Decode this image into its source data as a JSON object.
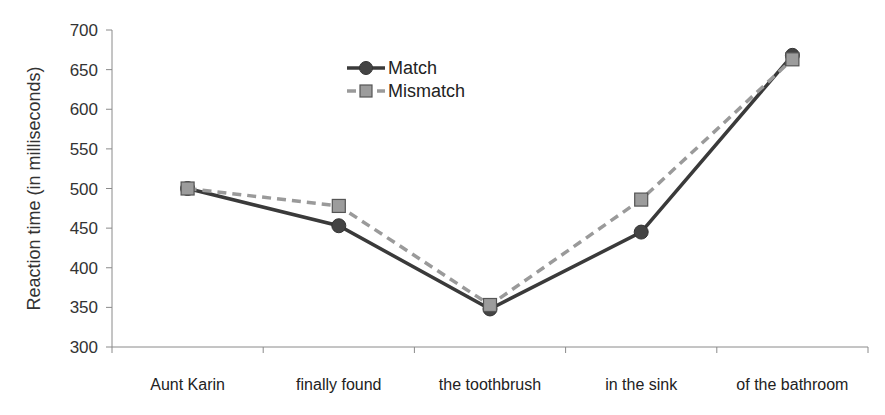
{
  "chart_data": {
    "type": "line",
    "title": "",
    "xlabel": "",
    "ylabel": "Reaction time (in milliseconds)",
    "ylim": [
      300,
      700
    ],
    "yticks": [
      300,
      350,
      400,
      450,
      500,
      550,
      600,
      650,
      700
    ],
    "categories": [
      "Aunt Karin",
      "finally found",
      "the toothbrush",
      "in the sink",
      "of the bathroom"
    ],
    "grid": false,
    "legend_position": "upper-center",
    "series": [
      {
        "name": "Match",
        "values": [
          500,
          453,
          348,
          445,
          668
        ],
        "color": "#3a3a3a",
        "style": "solid",
        "marker": "circle"
      },
      {
        "name": "Mismatch",
        "values": [
          500,
          478,
          353,
          486,
          663
        ],
        "color": "#9a9a9a",
        "style": "dashed",
        "marker": "square"
      }
    ]
  }
}
